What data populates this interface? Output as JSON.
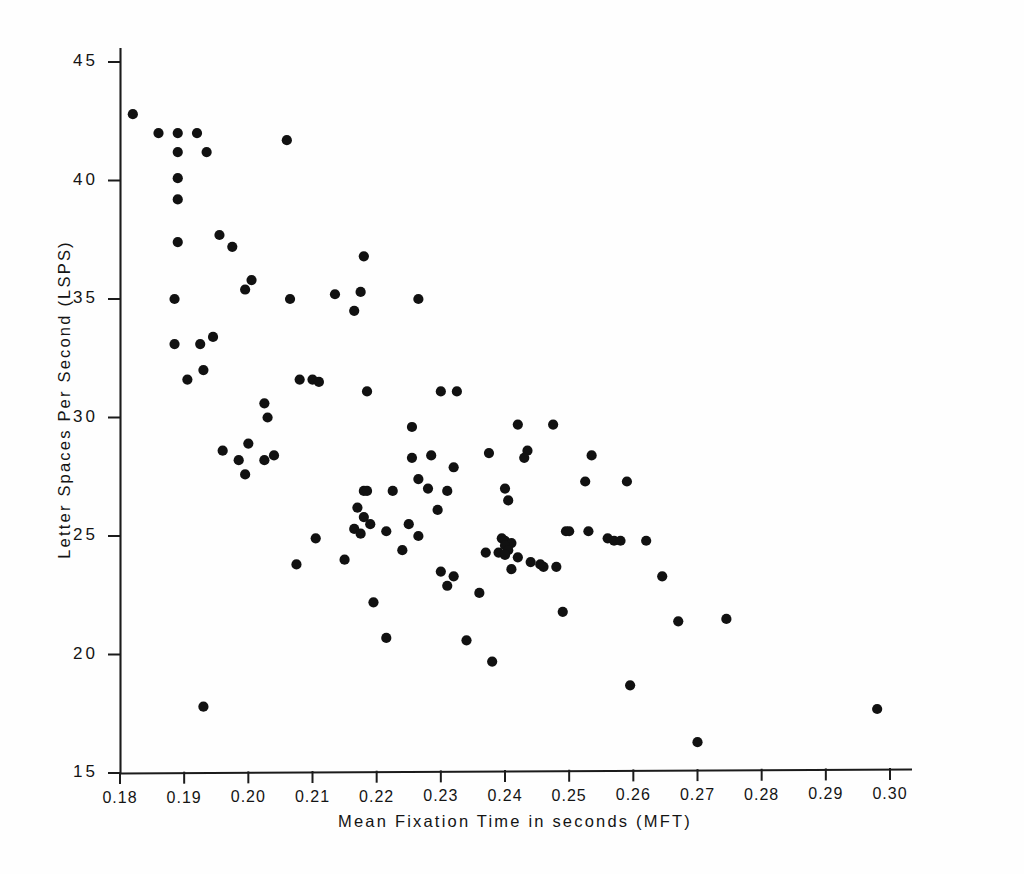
{
  "chart_data": {
    "type": "scatter",
    "title": "",
    "xlabel": "Mean Fixation Time in seconds (MFT)",
    "ylabel": "Letter Spaces Per Second (LSPS)",
    "xlim": [
      0.18,
      0.303
    ],
    "ylim": [
      15,
      45.8
    ],
    "grid": false,
    "legend": null,
    "marker": "filled-circle",
    "marker_color": "#111111",
    "xticks": [
      0.18,
      0.19,
      0.2,
      0.21,
      0.22,
      0.23,
      0.24,
      0.25,
      0.26,
      0.27,
      0.28,
      0.29,
      0.3
    ],
    "xtick_labels": [
      "0.18",
      "0.19",
      "0.20",
      "0.21",
      "0.22",
      "0.23",
      "0.24",
      "0.25",
      "0.26",
      "0.27",
      "0.28",
      "0.29",
      "0.30"
    ],
    "yticks": [
      15,
      20,
      25,
      30,
      35,
      40,
      45
    ],
    "ytick_labels": [
      "15",
      "20",
      "25",
      "30",
      "35",
      "40",
      "45"
    ],
    "n_points": 108,
    "x": [
      0.182,
      0.186,
      0.189,
      0.192,
      0.206,
      0.189,
      0.189,
      0.189,
      0.189,
      0.1935,
      0.1955,
      0.1975,
      0.1885,
      0.1995,
      0.1885,
      0.2005,
      0.2065,
      0.2135,
      0.218,
      0.2175,
      0.2265,
      0.1925,
      0.1945,
      0.193,
      0.2025,
      0.203,
      0.2165,
      0.1905,
      0.196,
      0.208,
      0.21,
      0.211,
      0.23,
      0.2325,
      0.242,
      0.2435,
      0.2185,
      0.2,
      0.2025,
      0.204,
      0.2475,
      0.2255,
      0.2285,
      0.2375,
      0.243,
      0.2535,
      0.1985,
      0.1995,
      0.232,
      0.24,
      0.2255,
      0.2265,
      0.2525,
      0.259,
      0.218,
      0.2185,
      0.2225,
      0.228,
      0.231,
      0.2405,
      0.217,
      0.218,
      0.219,
      0.225,
      0.2265,
      0.2395,
      0.24,
      0.241,
      0.256,
      0.257,
      0.2165,
      0.2175,
      0.2215,
      0.224,
      0.2295,
      0.24,
      0.2405,
      0.2495,
      0.25,
      0.253,
      0.2075,
      0.2105,
      0.215,
      0.237,
      0.239,
      0.24,
      0.242,
      0.244,
      0.246,
      0.23,
      0.232,
      0.241,
      0.2455,
      0.248,
      0.258,
      0.262,
      0.2645,
      0.2195,
      0.231,
      0.236,
      0.249,
      0.267,
      0.2745,
      0.2215,
      0.234,
      0.238,
      0.2595,
      0.193,
      0.298,
      0.27
    ],
    "y": [
      42.8,
      42.0,
      42.0,
      42.0,
      41.7,
      41.2,
      40.1,
      39.2,
      37.4,
      41.2,
      37.7,
      37.2,
      35.0,
      35.4,
      33.1,
      35.8,
      35.0,
      35.2,
      36.8,
      35.3,
      35.0,
      33.1,
      33.4,
      32.0,
      30.6,
      30.0,
      34.5,
      31.6,
      28.6,
      31.6,
      31.6,
      31.5,
      31.1,
      31.1,
      29.7,
      28.6,
      31.1,
      28.9,
      28.2,
      28.4,
      29.7,
      29.6,
      28.4,
      28.5,
      28.3,
      28.4,
      28.2,
      27.6,
      27.9,
      27.0,
      28.3,
      27.4,
      27.3,
      27.3,
      26.9,
      26.9,
      26.9,
      27.0,
      26.9,
      26.5,
      26.2,
      25.8,
      25.5,
      25.5,
      25.0,
      24.9,
      24.8,
      24.7,
      24.9,
      24.8,
      25.3,
      25.1,
      25.2,
      24.4,
      26.1,
      24.6,
      24.4,
      25.2,
      25.2,
      25.2,
      23.8,
      24.9,
      24.0,
      24.3,
      24.3,
      24.2,
      24.1,
      23.9,
      23.7,
      23.5,
      23.3,
      23.6,
      23.8,
      23.7,
      24.8,
      24.8,
      23.3,
      22.2,
      22.9,
      22.6,
      21.8,
      21.4,
      21.5,
      20.7,
      20.6,
      19.7,
      18.7,
      17.8,
      17.7,
      16.3
    ]
  },
  "axes": {
    "x_axis_name": "x-axis",
    "y_axis_name": "y-axis"
  }
}
